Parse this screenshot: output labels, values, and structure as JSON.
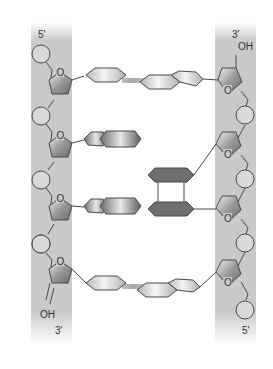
{
  "diagram": {
    "left_strand": {
      "top_label": "5'",
      "bottom_label": "3'",
      "terminal_group": "OH",
      "phosphates": 5,
      "sugars": 4
    },
    "right_strand": {
      "top_label": "3'",
      "bottom_label": "5'",
      "terminal_group": "OH",
      "phosphates": 4,
      "sugars": 4
    },
    "sugar_ring_atom": "O",
    "base_pairs": [
      {
        "row": 1,
        "left_base": "pyrimidine (single ring)",
        "right_base": "purine (double ring)",
        "paired": true,
        "style": "light"
      },
      {
        "row": 2,
        "left_base": "purine (double ring)",
        "right_base": "none",
        "paired": false,
        "style": "dark"
      },
      {
        "row": 3,
        "left_base": "purine (double ring)",
        "right_base": "pyrimidine dimer (stacked pair)",
        "paired": false,
        "style": "dark"
      },
      {
        "row": 4,
        "left_base": "pyrimidine (single ring)",
        "right_base": "purine (double ring)",
        "paired": true,
        "style": "light"
      }
    ],
    "colors": {
      "backbone_band": "#c8c8c8",
      "phosphate_fill": "#d9d9d9",
      "outline": "#4a4a4a",
      "dark_base": "#6e6e6e",
      "light_base": "#e6e6e6",
      "h_bond": "#b8b8b8"
    }
  }
}
